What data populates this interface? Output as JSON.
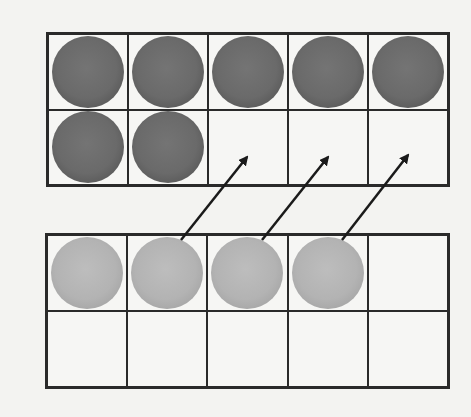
{
  "diagram": {
    "top_frame": {
      "rows": 2,
      "cols": 5,
      "cells": [
        "dark",
        "dark",
        "dark",
        "dark",
        "dark",
        "dark",
        "dark",
        "empty",
        "empty",
        "empty"
      ],
      "filled_count": 7
    },
    "bottom_frame": {
      "rows": 2,
      "cols": 5,
      "cells": [
        "light",
        "light",
        "light",
        "light",
        "empty",
        "empty",
        "empty",
        "empty",
        "empty",
        "empty"
      ],
      "filled_count": 4
    },
    "arrows": [
      {
        "from": "bottom_frame.cell_1",
        "to": "top_frame.cell_7"
      },
      {
        "from": "bottom_frame.cell_2",
        "to": "top_frame.cell_8"
      },
      {
        "from": "bottom_frame.cell_3",
        "to": "top_frame.cell_9"
      }
    ],
    "colors": {
      "dark_counter": "#6a6a6a",
      "light_counter": "#b3b3b3",
      "grid_line": "#2a2a2a",
      "background": "#f3f3f1"
    }
  }
}
